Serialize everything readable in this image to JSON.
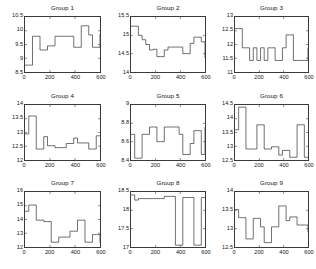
{
  "figure": {
    "layout": "3x3 grid of step plots",
    "background_color": "#ffffff",
    "line_color": "#333333",
    "axis_color": "#3a3a3a"
  },
  "chart_data": [
    {
      "type": "line",
      "title": "Group 1",
      "xlabel": "",
      "ylabel": "",
      "xlim": [
        0,
        600
      ],
      "ylim": [
        8.5,
        10.5
      ],
      "xticks": [
        0,
        200,
        400,
        600
      ],
      "yticks": [
        8.5,
        9,
        9.5,
        10,
        10.5
      ],
      "grid": false,
      "legend": "none",
      "drawstyle": "steps-post",
      "x": [
        0,
        30,
        60,
        90,
        120,
        150,
        180,
        210,
        240,
        270,
        300,
        330,
        360,
        390,
        420,
        450,
        480,
        510,
        540,
        570,
        600
      ],
      "y": [
        8.75,
        8.75,
        9.8,
        9.8,
        9.3,
        9.3,
        9.45,
        9.45,
        9.8,
        9.8,
        9.8,
        9.8,
        9.8,
        9.4,
        9.4,
        10.18,
        10.18,
        9.85,
        9.4,
        9.4,
        9.88
      ]
    },
    {
      "type": "line",
      "title": "Group 2",
      "xlabel": "",
      "ylabel": "",
      "xlim": [
        0,
        600
      ],
      "ylim": [
        14,
        15.5
      ],
      "xticks": [
        0,
        200,
        400,
        600
      ],
      "yticks": [
        14,
        14.5,
        15,
        15.5
      ],
      "grid": false,
      "legend": "none",
      "drawstyle": "steps-post",
      "x": [
        0,
        30,
        60,
        90,
        120,
        150,
        180,
        210,
        240,
        270,
        300,
        330,
        360,
        390,
        420,
        450,
        480,
        510,
        540,
        570,
        600
      ],
      "y": [
        15.25,
        15.25,
        15.0,
        14.88,
        14.75,
        14.6,
        14.62,
        14.42,
        14.42,
        14.6,
        14.68,
        14.68,
        14.68,
        14.68,
        14.5,
        14.5,
        14.78,
        14.95,
        14.95,
        14.82,
        14.38
      ]
    },
    {
      "type": "line",
      "title": "Group 3",
      "xlabel": "",
      "ylabel": "",
      "xlim": [
        0,
        600
      ],
      "ylim": [
        11,
        13
      ],
      "xticks": [
        0,
        200,
        400,
        600
      ],
      "yticks": [
        11,
        11.5,
        12,
        12.5,
        13
      ],
      "grid": false,
      "legend": "none",
      "drawstyle": "steps-post",
      "x": [
        0,
        30,
        60,
        90,
        120,
        150,
        180,
        210,
        240,
        270,
        300,
        330,
        360,
        390,
        420,
        450,
        480,
        510,
        540,
        570,
        600
      ],
      "y": [
        12.58,
        12.58,
        11.88,
        11.88,
        11.42,
        11.88,
        11.42,
        11.88,
        11.42,
        11.88,
        11.88,
        11.42,
        11.42,
        11.88,
        12.35,
        12.35,
        11.42,
        11.42,
        11.42,
        11.42,
        11.88
      ]
    },
    {
      "type": "line",
      "title": "Group 4",
      "xlabel": "",
      "ylabel": "",
      "xlim": [
        0,
        600
      ],
      "ylim": [
        12,
        14
      ],
      "xticks": [
        0,
        200,
        400,
        600
      ],
      "yticks": [
        12,
        12.5,
        13,
        13.5,
        14
      ],
      "grid": false,
      "legend": "none",
      "drawstyle": "steps-post",
      "x": [
        0,
        30,
        60,
        90,
        120,
        150,
        180,
        210,
        240,
        270,
        300,
        330,
        360,
        390,
        420,
        450,
        480,
        510,
        540,
        570,
        600
      ],
      "y": [
        12.95,
        13.6,
        13.6,
        12.4,
        12.4,
        12.85,
        12.52,
        12.52,
        12.45,
        12.45,
        12.45,
        12.6,
        12.6,
        12.8,
        12.62,
        12.62,
        12.62,
        12.4,
        12.4,
        12.88,
        12.88
      ]
    },
    {
      "type": "line",
      "title": "Group 5",
      "xlabel": "",
      "ylabel": "",
      "xlim": [
        0,
        600
      ],
      "ylim": [
        8.4,
        9
      ],
      "xticks": [
        0,
        200,
        400,
        600
      ],
      "yticks": [
        8.4,
        8.6,
        8.8,
        9
      ],
      "grid": false,
      "legend": "none",
      "drawstyle": "steps-post",
      "x": [
        0,
        30,
        60,
        90,
        120,
        150,
        180,
        210,
        240,
        270,
        300,
        330,
        360,
        390,
        420,
        450,
        480,
        510,
        540,
        570,
        600
      ],
      "y": [
        8.68,
        8.42,
        8.42,
        8.68,
        8.68,
        8.76,
        8.76,
        8.6,
        8.6,
        8.76,
        8.76,
        8.76,
        8.76,
        8.68,
        8.46,
        8.46,
        8.58,
        8.72,
        8.72,
        8.46,
        8.76
      ]
    },
    {
      "type": "line",
      "title": "Group 6",
      "xlabel": "",
      "ylabel": "",
      "xlim": [
        0,
        600
      ],
      "ylim": [
        12.5,
        14.5
      ],
      "xticks": [
        0,
        200,
        400,
        600
      ],
      "yticks": [
        12.5,
        13,
        13.5,
        14,
        14.5
      ],
      "grid": false,
      "legend": "none",
      "drawstyle": "steps-post",
      "x": [
        0,
        30,
        60,
        90,
        120,
        150,
        180,
        210,
        240,
        270,
        300,
        330,
        360,
        390,
        420,
        450,
        480,
        510,
        540,
        570,
        600
      ],
      "y": [
        13.6,
        14.42,
        14.42,
        12.9,
        12.9,
        12.9,
        13.78,
        13.78,
        12.9,
        12.9,
        12.98,
        12.98,
        12.68,
        12.85,
        12.85,
        12.6,
        12.6,
        13.78,
        13.78,
        12.6,
        12.6
      ]
    },
    {
      "type": "line",
      "title": "Group 7",
      "xlabel": "",
      "ylabel": "",
      "xlim": [
        0,
        600
      ],
      "ylim": [
        12,
        16
      ],
      "xticks": [
        0,
        200,
        400,
        600
      ],
      "yticks": [
        12,
        13,
        14,
        15,
        16
      ],
      "grid": false,
      "legend": "none",
      "drawstyle": "steps-post",
      "x": [
        0,
        30,
        60,
        90,
        120,
        150,
        180,
        210,
        240,
        270,
        300,
        330,
        360,
        390,
        420,
        450,
        480,
        510,
        540,
        570,
        600
      ],
      "y": [
        14.6,
        15.05,
        15.05,
        13.95,
        13.95,
        13.85,
        13.85,
        12.35,
        12.35,
        12.72,
        12.72,
        12.72,
        13.15,
        13.15,
        13.95,
        13.95,
        12.35,
        12.35,
        12.9,
        12.9,
        12.3
      ]
    },
    {
      "type": "line",
      "title": "Group 8",
      "xlabel": "",
      "ylabel": "",
      "xlim": [
        0,
        600
      ],
      "ylim": [
        17,
        18.5
      ],
      "xticks": [
        0,
        200,
        400,
        600
      ],
      "yticks": [
        17,
        17.5,
        18,
        18.5
      ],
      "grid": false,
      "legend": "none",
      "drawstyle": "steps-post",
      "x": [
        0,
        30,
        60,
        90,
        120,
        150,
        180,
        210,
        240,
        270,
        300,
        330,
        360,
        390,
        420,
        450,
        480,
        510,
        540,
        570,
        600
      ],
      "y": [
        18.42,
        18.28,
        18.32,
        18.32,
        18.32,
        18.32,
        18.32,
        18.32,
        18.32,
        18.38,
        18.38,
        18.38,
        17.05,
        17.05,
        18.35,
        18.35,
        18.35,
        17.05,
        17.05,
        18.35,
        18.35
      ]
    },
    {
      "type": "line",
      "title": "Group 9",
      "xlabel": "",
      "ylabel": "",
      "xlim": [
        0,
        600
      ],
      "ylim": [
        12.5,
        14
      ],
      "xticks": [
        0,
        200,
        400,
        600
      ],
      "yticks": [
        12.5,
        13,
        13.5,
        14
      ],
      "grid": false,
      "legend": "none",
      "drawstyle": "steps-post",
      "x": [
        0,
        30,
        60,
        90,
        120,
        150,
        180,
        210,
        240,
        270,
        300,
        330,
        360,
        390,
        420,
        450,
        480,
        510,
        540,
        570,
        600
      ],
      "y": [
        13.52,
        13.3,
        13.3,
        12.72,
        12.72,
        13.28,
        13.28,
        13.05,
        12.62,
        12.62,
        13.05,
        13.05,
        13.62,
        13.62,
        13.22,
        13.32,
        13.32,
        13.1,
        13.1,
        13.1,
        12.9
      ]
    }
  ]
}
